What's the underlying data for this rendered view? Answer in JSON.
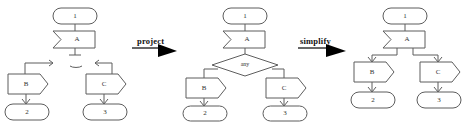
{
  "figure": {
    "type": "process-transformation-diagram",
    "background": "#ffffff",
    "stroke_color": "#5d5d5d",
    "text_color": "#333333",
    "arrow_color": "#000000"
  },
  "transitions": [
    {
      "id": "project",
      "label": "project"
    },
    {
      "id": "simplify",
      "label": "simplify"
    }
  ],
  "panels": [
    {
      "id": "panel-1",
      "caption": "",
      "nodes": {
        "start": {
          "label": "1",
          "shape": "stadium"
        },
        "task_a": {
          "label": "A",
          "shape": "notched-chevron"
        },
        "stub": {
          "label": "",
          "shape": "dangling-stub"
        },
        "task_b": {
          "label": "B",
          "shape": "pentagon-arrow"
        },
        "task_c": {
          "label": "C",
          "shape": "pentagon-arrow"
        },
        "end_b": {
          "label": "2",
          "shape": "stadium"
        },
        "end_c": {
          "label": "3",
          "shape": "stadium"
        }
      }
    },
    {
      "id": "panel-2",
      "caption": "",
      "nodes": {
        "start": {
          "label": "1",
          "shape": "stadium"
        },
        "task_a": {
          "label": "A",
          "shape": "notched-chevron"
        },
        "gateway": {
          "label": "any",
          "shape": "diamond"
        },
        "task_b": {
          "label": "B",
          "shape": "pentagon-arrow"
        },
        "task_c": {
          "label": "C",
          "shape": "pentagon-arrow"
        },
        "end_b": {
          "label": "2",
          "shape": "stadium"
        },
        "end_c": {
          "label": "3",
          "shape": "stadium"
        }
      }
    },
    {
      "id": "panel-3",
      "caption": "",
      "nodes": {
        "start": {
          "label": "1",
          "shape": "stadium"
        },
        "task_a": {
          "label": "A",
          "shape": "notched-chevron"
        },
        "task_b": {
          "label": "B",
          "shape": "pentagon-arrow"
        },
        "task_c": {
          "label": "C",
          "shape": "pentagon-arrow"
        },
        "end_b": {
          "label": "2",
          "shape": "stadium"
        },
        "end_c": {
          "label": "3",
          "shape": "stadium"
        }
      }
    }
  ]
}
